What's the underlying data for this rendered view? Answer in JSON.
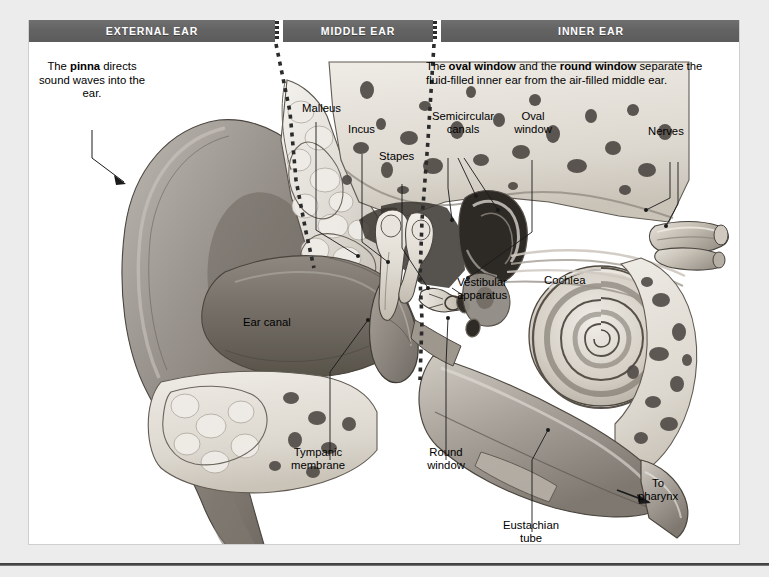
{
  "figure": {
    "type": "anatomical-diagram",
    "background": "#ffffff",
    "frame_color": "#cfcfcf"
  },
  "banner": {
    "band_color": "#636363",
    "text_color": "#ffffff",
    "divider_style": "vertical-dotted",
    "sections": [
      {
        "key": "external",
        "label": "EXTERNAL EAR"
      },
      {
        "key": "middle",
        "label": "MIDDLE EAR"
      },
      {
        "key": "inner",
        "label": "INNER EAR"
      }
    ]
  },
  "notes": {
    "pinna": {
      "prefix": "The ",
      "bold": "pinna",
      "suffix": " directs sound waves into the ear.",
      "full": "The pinna directs sound waves into the ear."
    },
    "windows": {
      "seg1": "The ",
      "bold1": "oval window",
      "seg2": " and the ",
      "bold2": "round window",
      "seg3": " separate the fluid-filled inner ear from the air-filled middle ear.",
      "full": "The oval window and the round window separate the fluid-filled inner ear from the air-filled middle ear."
    }
  },
  "labels": {
    "malleus": "Malleus",
    "incus": "Incus",
    "stapes": "Stapes",
    "semicircular_canals": "Semicircular\ncanals",
    "oval_window": "Oval\nwindow",
    "nerves": "Nerves",
    "vestibular_apparatus": "Vestibular\napparatus",
    "cochlea": "Cochlea",
    "ear_canal": "Ear canal",
    "tympanic_membrane": "Tympanic\nmembrane",
    "round_window": "Round\nwindow",
    "eustachian_tube": "Eustachian\ntube",
    "to_pharynx": "To\npharynx"
  },
  "structures": [
    {
      "name": "pinna",
      "region": "external",
      "label_key": "pinna"
    },
    {
      "name": "ear-canal",
      "region": "external",
      "label_key": "ear_canal"
    },
    {
      "name": "tympanic-membrane",
      "region": "middle",
      "label_key": "tympanic_membrane"
    },
    {
      "name": "malleus",
      "region": "middle",
      "label_key": "malleus"
    },
    {
      "name": "incus",
      "region": "middle",
      "label_key": "incus"
    },
    {
      "name": "stapes",
      "region": "middle",
      "label_key": "stapes"
    },
    {
      "name": "oval-window",
      "region": "middle",
      "label_key": "oval_window"
    },
    {
      "name": "round-window",
      "region": "middle",
      "label_key": "round_window"
    },
    {
      "name": "eustachian-tube",
      "region": "middle",
      "label_key": "eustachian_tube"
    },
    {
      "name": "semicircular-canals",
      "region": "inner",
      "label_key": "semicircular_canals"
    },
    {
      "name": "vestibular-apparatus",
      "region": "inner",
      "label_key": "vestibular_apparatus"
    },
    {
      "name": "cochlea",
      "region": "inner",
      "label_key": "cochlea"
    },
    {
      "name": "nerves",
      "region": "inner",
      "label_key": "nerves"
    }
  ],
  "palette": {
    "page_background": "#ececec",
    "banner_gray": "#636363",
    "bone_light": "#e2ded6",
    "bone_mid": "#c3bcb1",
    "marrow_dark": "#4d4d4d",
    "soft_tissue": "#8f8a85",
    "canal_dark": "#6b6560",
    "cartilage": "#d8d4cc",
    "outline": "#3a3a3a",
    "rule": "#3a3a3a"
  }
}
